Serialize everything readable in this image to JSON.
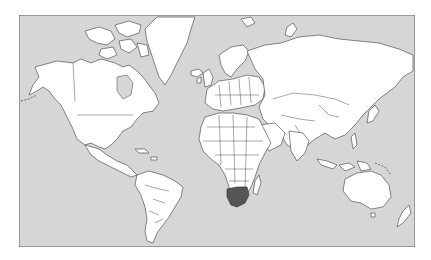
{
  "map": {
    "projection": "Mercator world map",
    "colors": {
      "ocean": "#d6d6d6",
      "land": "#ffffff",
      "border": "#3a3a3a",
      "highlight": "#555555",
      "frame": "#6e6e6e"
    },
    "highlighted_regions": [
      "South Africa",
      "Lesotho",
      "Swaziland"
    ],
    "highlighted_country": "South Africa",
    "continents": [
      "North America",
      "Greenland",
      "South America",
      "Europe",
      "Africa",
      "Asia",
      "Australia",
      "New Zealand",
      "Antarctic islands"
    ]
  }
}
